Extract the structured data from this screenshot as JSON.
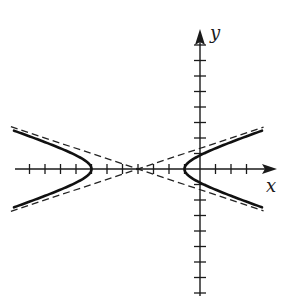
{
  "figure": {
    "axes": {
      "x_label": "x",
      "y_label": "y",
      "x_range": [
        -12,
        5
      ],
      "y_range": [
        -8,
        9
      ],
      "tick_spacing": 1,
      "x_ticks": [
        -11,
        -10,
        -9,
        -8,
        -7,
        -6,
        -5,
        -4,
        -3,
        -2,
        -1,
        1,
        2,
        3
      ],
      "y_ticks": [
        -8,
        -7,
        -6,
        -5,
        -4,
        -3,
        -2,
        -1,
        1,
        2,
        3,
        4,
        5,
        6,
        7,
        8
      ]
    },
    "hyperbola": {
      "equation": "(x+4)^2/9 - y^2 = 1",
      "center": [
        -4,
        0
      ],
      "a": 3,
      "b": 1,
      "vertices": [
        [
          -7,
          0
        ],
        [
          -1,
          0
        ]
      ],
      "x_extent": [
        -12,
        4
      ],
      "stroke_color": "#111111",
      "stroke_style": "solid-thick"
    },
    "asymptotes": {
      "equations": [
        "y = (x+4)/3",
        "y = -(x+4)/3"
      ],
      "slope": 0.3333,
      "stroke_color": "#222222",
      "stroke_style": "dashed"
    },
    "colors": {
      "background": "#ffffff",
      "ink": "#1a1a1a"
    }
  }
}
